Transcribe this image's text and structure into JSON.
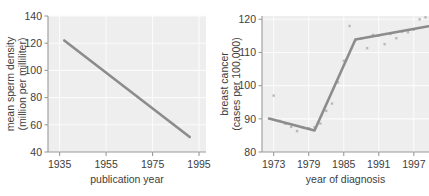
{
  "figure": {
    "panel_count": 2,
    "background_color": "#ffffff",
    "plot_background_color": "#eeeeee",
    "gridline_color": "#fbfbfb",
    "axis_color": "#9a9a9a",
    "trend_color": "#8c8c8c",
    "point_color": "#b9b9b9"
  },
  "chart_data": [
    {
      "id": "sperm-density",
      "type": "line",
      "title": "",
      "xlabel": "publication year",
      "ylabel": "mean sperm density\n(million per milliliter)",
      "ylabel_line1": "mean sperm density",
      "ylabel_line2": "(million per milliliter)",
      "xlim": [
        1930,
        1998
      ],
      "ylim": [
        40,
        140
      ],
      "xticks": [
        1935,
        1955,
        1975,
        1995
      ],
      "xtick_labels": [
        "1935",
        "1955",
        "1975",
        "1995"
      ],
      "yticks": [
        40,
        60,
        80,
        100,
        120,
        140
      ],
      "ytick_labels": [
        "40",
        "60",
        "80",
        "100",
        "120",
        "140"
      ],
      "grid": true,
      "grid_axis": "both",
      "legend": false,
      "series": [
        {
          "name": "regression line",
          "kind": "line",
          "x": [
            1937,
            1991
          ],
          "values": [
            122,
            51
          ]
        }
      ],
      "annotations": []
    },
    {
      "id": "breast-cancer",
      "type": "scatter",
      "title": "",
      "xlabel": "year of diagnosis",
      "ylabel": "breast cancer\n(cases per 100,000)",
      "ylabel_line1": "breast cancer",
      "ylabel_line2": "(cases per 100,000)",
      "xlim": [
        1971,
        1999.6
      ],
      "ylim": [
        80,
        121
      ],
      "xticks": [
        1973,
        1979,
        1985,
        1991,
        1997
      ],
      "xtick_labels": [
        "1973",
        "1979",
        "1985",
        "1991",
        "1997"
      ],
      "yticks": [
        80,
        90,
        100,
        110,
        120
      ],
      "ytick_labels": [
        "80",
        "90",
        "100",
        "110",
        "120"
      ],
      "grid": true,
      "grid_axis": "both",
      "legend": false,
      "series": [
        {
          "name": "observed rate",
          "kind": "scatter",
          "x": [
            1973,
            1974,
            1975,
            1976,
            1977,
            1978,
            1979,
            1980,
            1981,
            1982,
            1983,
            1984,
            1985,
            1986,
            1987,
            1988,
            1989,
            1990,
            1991,
            1992,
            1993,
            1994,
            1995,
            1996,
            1997,
            1998,
            1999
          ],
          "values": [
            97.0,
            89.4,
            88.5,
            87.6,
            86.3,
            87.4,
            87.2,
            87.5,
            88.6,
            92.4,
            94.6,
            101.0,
            107.5,
            118.0,
            113.8,
            114.2,
            111.3,
            115.3,
            115.1,
            112.5,
            115.6,
            114.3,
            116.3,
            116.1,
            116.9,
            120.0,
            120.6
          ]
        },
        {
          "name": "segmented regression",
          "kind": "line",
          "x": [
            1972.2,
            1980.0,
            1987.0,
            1999.5
          ],
          "values": [
            90.1,
            86.5,
            113.9,
            117.9
          ]
        }
      ],
      "annotations": []
    }
  ]
}
